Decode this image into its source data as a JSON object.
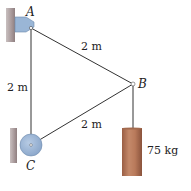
{
  "diagram": {
    "points": {
      "A": {
        "label": "A",
        "x": 31,
        "y": 28
      },
      "B": {
        "label": "B",
        "x": 133,
        "y": 84
      },
      "C": {
        "label": "C",
        "x": 31,
        "y": 145
      }
    },
    "dimensions": {
      "AB": "2 m",
      "AC": "2 m",
      "CB": "2 m"
    },
    "mass": {
      "label": "75 kg",
      "color": "#b47a5a"
    },
    "colors": {
      "wall": "#a89a9a",
      "bracket": "#9ab6d6",
      "pulley": "#9ab6d6",
      "line": "#333333"
    }
  }
}
